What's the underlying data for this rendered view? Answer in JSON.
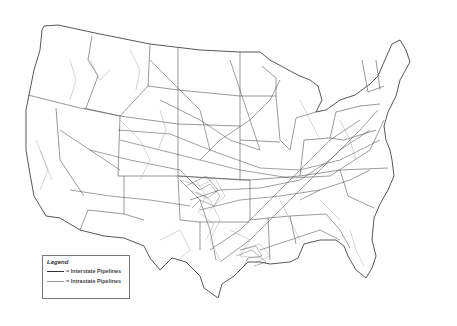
{
  "map": {
    "title": "",
    "region": "Contiguous United States",
    "subject": "Natural gas pipelines",
    "colors": {
      "interstate": "#333333",
      "intrastate": "#999999",
      "state_border": "#555555",
      "background": "#ffffff"
    }
  },
  "legend": {
    "title": "Legend",
    "items": [
      {
        "label": "= Interstate Pipelines",
        "color": "#333333"
      },
      {
        "label": "= Intrastate Pipelines",
        "color": "#999999"
      }
    ]
  }
}
